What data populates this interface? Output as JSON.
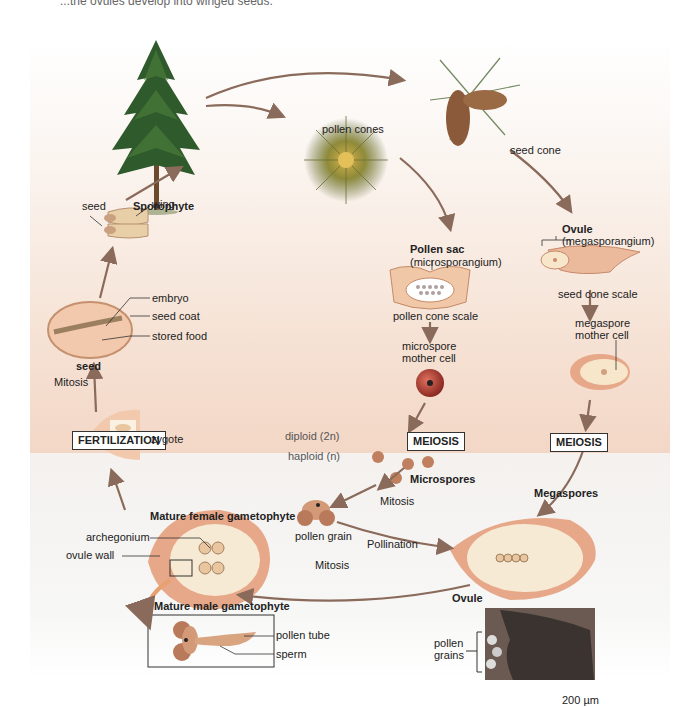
{
  "caption_fragment": "...the ovules develop into winged seeds.",
  "zones": {
    "diploid": "diploid (2n)",
    "haploid": "haploid (n)"
  },
  "stages": {
    "sporophyte": "Sporophyte",
    "pollen_cones": "pollen cones",
    "seed_cone": "seed cone",
    "pollen_sac": "Pollen sac",
    "pollen_sac_sub": "(microsporangium)",
    "pollen_cone_scale": "pollen cone scale",
    "microspore_mother_cell_1": "microspore",
    "microspore_mother_cell_2": "mother cell",
    "ovule": "Ovule",
    "ovule_sub": "(megasporangium)",
    "seed_cone_scale": "seed cone scale",
    "megaspore_mother_cell_1": "megaspore",
    "megaspore_mother_cell_2": "mother cell",
    "meiosis_left": "MEIOSIS",
    "meiosis_right": "MEIOSIS",
    "microspores": "Microspores",
    "megaspores": "Megaspores",
    "mitosis_pollen": "Mitosis",
    "pollen_grain": "pollen grain",
    "pollination": "Pollination",
    "ovule_bottom": "Ovule",
    "mitosis_bottom": "Mitosis",
    "mature_female": "Mature female gametophyte",
    "archegonium": "archegonium",
    "ovule_wall": "ovule wall",
    "mature_male": "Mature male gametophyte",
    "pollen_tube": "pollen tube",
    "sperm": "sperm",
    "pollen_grains_1": "pollen",
    "pollen_grains_2": "grains",
    "scale_bar": "200 µm",
    "fertilization": "FERTILIZATION",
    "zygote": "zygote",
    "mitosis_left": "Mitosis",
    "seed_bold": "seed",
    "embryo": "embryo",
    "seed_coat": "seed coat",
    "stored_food": "stored food",
    "seed_small": "seed",
    "wing": "wing"
  },
  "colors": {
    "arrow": "#8a6a5a",
    "ovule_outer": "#e6a889",
    "ovule_inner": "#f7e6c9",
    "tree": "#2f5a2b",
    "microspore_mother": "#b5443a",
    "pollen_grain": "#c98a6a"
  }
}
